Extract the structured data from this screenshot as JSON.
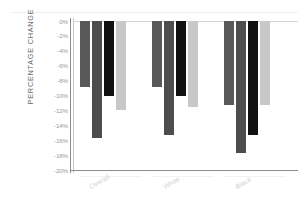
{
  "chart_data": {
    "type": "bar",
    "title": "",
    "xlabel": "",
    "ylabel": "PERCENTAGE CHANGE",
    "categories": [
      "Overall",
      "White",
      "Black"
    ],
    "ylim": [
      -20,
      0
    ],
    "yticks": [
      "0%",
      "-2%",
      "-4%",
      "-6%",
      "-8%",
      "-10%",
      "-12%",
      "-14%",
      "-16%",
      "-18%",
      "-20%"
    ],
    "ytick_values": [
      0,
      -2,
      -4,
      -6,
      -8,
      -10,
      -12,
      -14,
      -16,
      -18,
      -20
    ],
    "grid": false,
    "legend": "none",
    "series": [
      {
        "name": "series-1",
        "color": "#595959",
        "values": [
          -8.8,
          -8.8,
          -11.3
        ]
      },
      {
        "name": "series-2",
        "color": "#4d4d4d",
        "values": [
          -15.7,
          -15.3,
          -17.7
        ]
      },
      {
        "name": "series-3",
        "color": "#111111",
        "values": [
          -10.0,
          -10.0,
          -15.3
        ]
      },
      {
        "name": "series-4",
        "color": "#c8c8c8",
        "values": [
          -12.0,
          -11.6,
          -11.3
        ]
      }
    ]
  },
  "axis": {
    "y_title": "PERCENTAGE CHANGE",
    "tick_0": "0%",
    "tick_1": "-2%",
    "tick_2": "-4%",
    "tick_3": "-6%",
    "tick_4": "-8%",
    "tick_5": "-10%",
    "tick_6": "-12%",
    "tick_7": "-14%",
    "tick_8": "-16%",
    "tick_9": "-18%",
    "tick_10": "-20%"
  },
  "categories": {
    "c0": "Overall",
    "c1": "White",
    "c2": "Black"
  },
  "header": {
    "cropped_title": ""
  }
}
